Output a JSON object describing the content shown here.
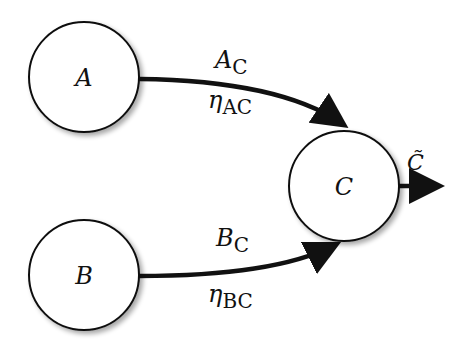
{
  "diagram": {
    "nodes": [
      {
        "id": "A",
        "label": "A",
        "cx": 84,
        "cy": 77,
        "r": 55
      },
      {
        "id": "B",
        "label": "B",
        "cx": 84,
        "cy": 275,
        "r": 55
      },
      {
        "id": "C",
        "label": "C",
        "cx": 344,
        "cy": 186,
        "r": 55
      }
    ],
    "edges": [
      {
        "from": "A",
        "to": "C",
        "top_label": {
          "main": "A",
          "sub": "C"
        },
        "bottom_label": {
          "main": "η",
          "sub": "AC"
        }
      },
      {
        "from": "B",
        "to": "C",
        "top_label": {
          "main": "B",
          "sub": "C"
        },
        "bottom_label": {
          "main": "η",
          "sub": "BC"
        }
      }
    ],
    "output": {
      "from": "C",
      "label": "C̃"
    }
  }
}
